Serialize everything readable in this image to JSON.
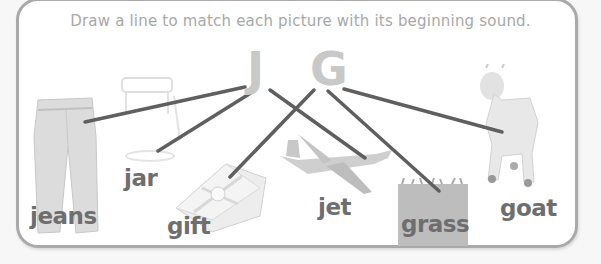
{
  "worksheet": {
    "instruction": "Draw a line to match each picture with its beginning sound.",
    "letters": [
      "J",
      "G"
    ],
    "pictures": [
      {
        "label": "jeans",
        "icon": "jeans-icon"
      },
      {
        "label": "jar",
        "icon": "jar-icon"
      },
      {
        "label": "gift",
        "icon": "gift-icon"
      },
      {
        "label": "jet",
        "icon": "jet-icon"
      },
      {
        "label": "grass",
        "icon": "grass-icon"
      },
      {
        "label": "goat",
        "icon": "goat-icon"
      }
    ],
    "matches": [
      {
        "letter": "J",
        "picture": "jeans"
      },
      {
        "letter": "J",
        "picture": "jar"
      },
      {
        "letter": "J",
        "picture": "jet"
      },
      {
        "letter": "G",
        "picture": "gift"
      },
      {
        "letter": "G",
        "picture": "grass"
      },
      {
        "letter": "G",
        "picture": "goat"
      }
    ],
    "colors": {
      "frame": "#a9a9a9",
      "line": "#5f5f5f",
      "letter": "#c8c8c8",
      "word": "#6e6e6e",
      "instruction": "#a8a8a8"
    }
  }
}
